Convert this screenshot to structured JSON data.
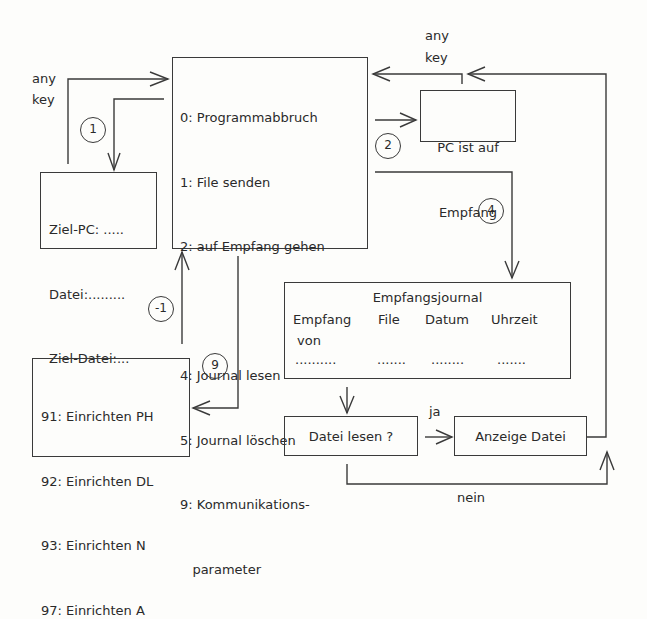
{
  "main_menu": {
    "items": [
      {
        "key": "0",
        "label": "0: Programmabbruch"
      },
      {
        "key": "1",
        "label": "1: File senden"
      },
      {
        "key": "2",
        "label": "2: auf Empfang gehen"
      },
      {
        "key": "4",
        "label": "4: Journal lesen"
      },
      {
        "key": "5",
        "label": "5: Journal löschen"
      },
      {
        "key": "9",
        "label": "9: Kommunikations-"
      },
      {
        "key": "9b",
        "label": "   parameter"
      }
    ]
  },
  "send_form": {
    "lines": [
      "Ziel-PC: .....",
      "Datei:.........",
      "Ziel-Datei:..."
    ]
  },
  "receive_box": {
    "line1": "PC ist auf",
    "line2": "Empfang"
  },
  "journal": {
    "title": "Empfangsjournal",
    "headers": [
      "Empfang",
      "File",
      "Datum",
      "Uhrzeit"
    ],
    "subheader": "von",
    "dots": [
      "..........",
      ".......",
      "........",
      "......."
    ]
  },
  "decision": {
    "label": "Datei lesen ?"
  },
  "display": {
    "label": "Anzeige Datei"
  },
  "setup_menu": {
    "items": [
      "91: Einrichten PH",
      "92: Einrichten DL",
      "93: Einrichten N",
      "97: Einrichten A"
    ]
  },
  "labels": {
    "any_key_left_1": "any",
    "any_key_left_2": "key",
    "any_key_right_1": "any",
    "any_key_right_2": "key",
    "yes": "ja",
    "no": "nein"
  },
  "circles": {
    "c1": "1",
    "c2": "2",
    "c4": "4",
    "c9": "9",
    "cm1": "-1"
  }
}
